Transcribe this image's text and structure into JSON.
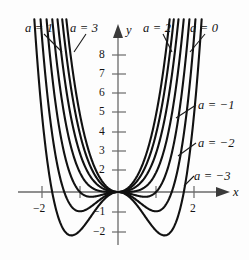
{
  "figure": {
    "axis_x_label": "x",
    "axis_y_label": "y"
  },
  "labels": {
    "a1": "a = 1",
    "a3": "a = 3",
    "a2": "a = 2",
    "a0": "a = 0",
    "am1": "a = −1",
    "am2": "a = −2",
    "am3": "a = −3"
  },
  "ticks": {
    "x": [
      "−2",
      "2"
    ],
    "y": [
      "8",
      "7",
      "6",
      "5",
      "4",
      "3",
      "2",
      "−1",
      "−2"
    ]
  },
  "colors": {
    "curve": "#111111",
    "axis": "#5a5a5a",
    "text": "#141414",
    "background": "#fdfdfd"
  },
  "chart_data": {
    "type": "line",
    "title": "",
    "xlabel": "x",
    "ylabel": "y",
    "xlim": [
      -2.6,
      2.6
    ],
    "ylim": [
      -2.6,
      8.8
    ],
    "grid": false,
    "legend_position": "inline-annotations",
    "function_form": "y = x^4 + a*x^2",
    "x_ticks": [
      -2,
      -1,
      1,
      2
    ],
    "x_tick_labels": [
      "−2",
      "",
      "",
      "2"
    ],
    "y_ticks": [
      8,
      7,
      6,
      5,
      4,
      3,
      2,
      -1,
      -2
    ],
    "y_tick_labels": [
      "8",
      "7",
      "6",
      "5",
      "4",
      "3",
      "2",
      "−1",
      "−2"
    ],
    "series": [
      {
        "name": "a = 3",
        "a": 3,
        "label": "a = 3",
        "annotation_side": "top-left"
      },
      {
        "name": "a = 2",
        "a": 2,
        "label": "a = 2",
        "annotation_side": "top-right"
      },
      {
        "name": "a = 1",
        "a": 1,
        "label": "a = 1",
        "annotation_side": "top-left"
      },
      {
        "name": "a = 0",
        "a": 0,
        "label": "a = 0",
        "annotation_side": "top-right"
      },
      {
        "name": "a = -1",
        "a": -1,
        "label": "a = −1",
        "annotation_side": "right"
      },
      {
        "name": "a = -2",
        "a": -2,
        "label": "a = −2",
        "annotation_side": "right"
      },
      {
        "name": "a = -3",
        "a": -3,
        "label": "a = −3",
        "annotation_side": "right"
      }
    ]
  }
}
